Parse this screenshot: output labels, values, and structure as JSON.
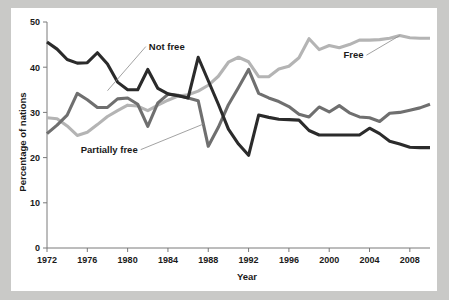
{
  "figure": {
    "background_color": "#c9c9c7",
    "card_color": "#ffffff"
  },
  "chart_data": {
    "type": "line",
    "title": "",
    "xlabel": "Year",
    "ylabel": "Percentage of nations",
    "xlim": [
      1972,
      2010
    ],
    "ylim": [
      0,
      50
    ],
    "grid": false,
    "legend_position": "inline-annotations",
    "xticks": [
      1972,
      1976,
      1980,
      1984,
      1988,
      1992,
      1996,
      2000,
      2004,
      2008
    ],
    "xtick_labels": [
      "1972",
      "1976",
      "1980",
      "1984",
      "1988",
      "1992",
      "1996",
      "2000",
      "2004",
      "2008"
    ],
    "yticks": [
      0,
      10,
      20,
      30,
      40,
      50
    ],
    "ytick_labels": [
      "0",
      "10",
      "20",
      "30",
      "40",
      "50"
    ],
    "x": [
      1972,
      1973,
      1974,
      1975,
      1976,
      1977,
      1978,
      1979,
      1980,
      1981,
      1982,
      1983,
      1984,
      1985,
      1986,
      1987,
      1988,
      1989,
      1990,
      1991,
      1992,
      1993,
      1994,
      1995,
      1996,
      1997,
      1998,
      1999,
      2000,
      2001,
      2002,
      2003,
      2004,
      2005,
      2006,
      2007,
      2008,
      2009,
      2010
    ],
    "series": [
      {
        "name": "Free",
        "color": "#b4b4b4",
        "annotation_label": "Free",
        "values": [
          28.8,
          28.6,
          27.0,
          24.9,
          25.6,
          27.3,
          29.1,
          30.4,
          31.6,
          31.4,
          30.4,
          31.6,
          32.7,
          33.6,
          33.9,
          34.7,
          36.0,
          38.0,
          41.1,
          42.2,
          41.2,
          37.9,
          37.9,
          39.6,
          40.2,
          42.1,
          46.3,
          43.9,
          44.8,
          44.3,
          45.0,
          46.0,
          46.0,
          46.1,
          46.4,
          47.0,
          46.5,
          46.4,
          46.4
        ]
      },
      {
        "name": "Partially free",
        "color": "#6f6f6f",
        "annotation_label": "Partially free",
        "values": [
          25.3,
          27.2,
          29.4,
          34.2,
          32.8,
          31.1,
          31.1,
          33.0,
          33.2,
          31.8,
          26.9,
          32.1,
          34.0,
          33.8,
          33.2,
          32.6,
          22.5,
          26.7,
          31.7,
          35.5,
          39.5,
          34.2,
          33.2,
          32.4,
          31.3,
          29.6,
          29.0,
          31.2,
          30.1,
          31.5,
          29.9,
          29.0,
          28.8,
          28.0,
          29.8,
          30.0,
          30.5,
          31.0,
          31.8
        ]
      },
      {
        "name": "Not free",
        "color": "#2b2b2b",
        "annotation_label": "Not free",
        "values": [
          45.6,
          44.0,
          41.7,
          40.9,
          41.0,
          43.2,
          40.7,
          36.7,
          35.0,
          35.0,
          39.5,
          35.3,
          34.1,
          33.7,
          33.2,
          42.2,
          37.0,
          31.8,
          26.3,
          23.0,
          20.5,
          29.4,
          28.9,
          28.5,
          28.4,
          28.3,
          26.0,
          25.0,
          25.0,
          25.0,
          25.0,
          25.0,
          26.5,
          25.3,
          23.6,
          23.0,
          22.3,
          22.2,
          22.2
        ]
      }
    ],
    "annotations": [
      {
        "label": "Not free",
        "at_year": 1978,
        "at_value": 34.8,
        "text_x": 1982.1,
        "text_y": 43.9
      },
      {
        "label": "Partially free",
        "at_year": 1987.6,
        "at_value": 27.5,
        "text_x": 1981.0,
        "text_y": 21.1
      },
      {
        "label": "Free",
        "at_year": 2007.0,
        "at_value": 47.0,
        "text_x": 2003.4,
        "text_y": 42.0
      }
    ]
  }
}
